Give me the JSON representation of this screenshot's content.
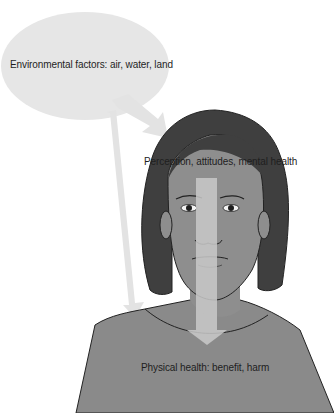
{
  "diagram": {
    "type": "illustration-flow",
    "labels": {
      "environmental": "Environmental factors: air, water, land",
      "perception": "Perception, attitudes, mental health",
      "physical": "Physical health: benefit, harm"
    },
    "arrows": [
      {
        "from": "environmental",
        "to": "perception"
      },
      {
        "from": "environmental",
        "to": "physical"
      },
      {
        "from": "perception",
        "to": "physical"
      }
    ],
    "colors": {
      "bubble": "#e6e6e6",
      "arrow": "#e2e2e2",
      "face_arrow": "#c9c9c9",
      "hair": "#3f3f3f",
      "skin": "#8e8e8e",
      "shirt": "#8a8a8a",
      "outline": "#222222"
    }
  }
}
